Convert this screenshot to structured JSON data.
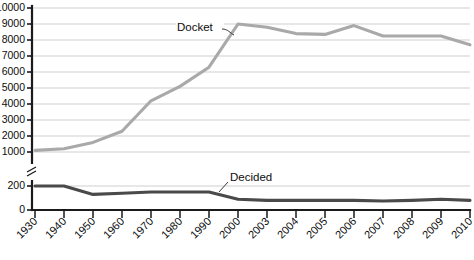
{
  "chart_data": {
    "type": "line",
    "title": "",
    "xlabel": "",
    "ylabel": "",
    "categories": [
      "1930",
      "1940",
      "1950",
      "1960",
      "1970",
      "1980",
      "1990",
      "2000",
      "2003",
      "2004",
      "2005",
      "2006",
      "2007",
      "2008",
      "2009",
      "2010"
    ],
    "series": [
      {
        "name": "Docket",
        "color": "#a9a9a9",
        "values": [
          1100,
          1200,
          1600,
          2300,
          4200,
          5100,
          6300,
          9000,
          8800,
          8400,
          8350,
          8900,
          8250,
          8250,
          8250,
          7700
        ]
      },
      {
        "name": "Decided",
        "color": "#4a4a4a",
        "values": [
          200,
          200,
          130,
          140,
          150,
          150,
          150,
          90,
          80,
          80,
          80,
          80,
          75,
          80,
          90,
          80
        ]
      }
    ],
    "ytick_labels_upper": [
      "10000",
      "9000",
      "8000",
      "7000",
      "6000",
      "5000",
      "4000",
      "3000",
      "2000",
      "1000"
    ],
    "ytick_values_upper": [
      10000,
      9000,
      8000,
      7000,
      6000,
      5000,
      4000,
      3000,
      2000,
      1000
    ],
    "ytick_labels_lower": [
      "200",
      "0"
    ],
    "ytick_values_lower": [
      200,
      0
    ],
    "ylim_upper": [
      1000,
      10000
    ],
    "ylim_lower": [
      0,
      200
    ],
    "axis_break": true,
    "grid": true,
    "legend": "inline-annotations",
    "annotations": [
      {
        "label": "Docket",
        "x_category": "2000",
        "value": 9000
      },
      {
        "label": "Decided",
        "x_category": "2000",
        "value": 90
      }
    ]
  },
  "axis": {
    "break_symbol_name": "y-axis-break"
  }
}
